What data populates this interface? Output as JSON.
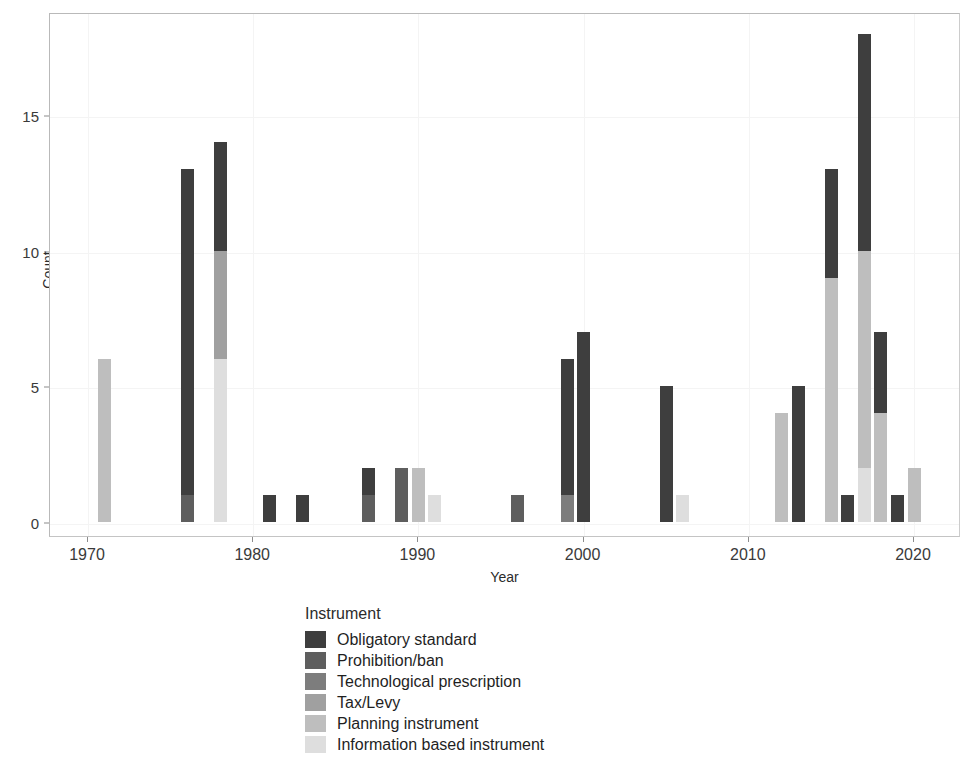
{
  "chart_data": {
    "type": "bar",
    "subtype": "stacked-bar",
    "title": "",
    "xlabel": "Year",
    "ylabel": "Count",
    "xlim": [
      1968.5,
      2021.5
    ],
    "ylim": [
      0,
      19.2
    ],
    "x_ticks": [
      1970,
      1980,
      1990,
      2000,
      2010,
      2020
    ],
    "x_tick_labels": [
      "1970",
      "1980",
      "1990",
      "2000",
      "2010",
      "2020"
    ],
    "y_ticks": [
      0,
      5,
      10,
      15
    ],
    "y_tick_labels": [
      "0",
      "5",
      "10",
      "15"
    ],
    "grid": true,
    "legend_position": "bottom",
    "legend_title": "Instrument",
    "series": [
      {
        "name": "Obligatory standard",
        "color": "#3e3e3e",
        "years": [
          1976,
          1978,
          1981,
          1983,
          1987,
          1999,
          2000,
          2005,
          2013,
          2015,
          2016,
          2017,
          2018,
          2019
        ],
        "values": [
          12,
          4,
          1,
          1,
          1,
          5,
          7,
          5,
          5,
          4,
          1,
          8,
          3,
          1
        ]
      },
      {
        "name": "Prohibition/ban",
        "color": "#5e5e5e",
        "years": [
          1976,
          1989,
          1996
        ],
        "values": [
          1,
          2,
          1
        ]
      },
      {
        "name": "Technological prescription",
        "color": "#7d7d7d",
        "years": [
          1999
        ],
        "values": [
          1
        ]
      },
      {
        "name": "Tax/Levy",
        "color": "#a0a0a0",
        "years": [
          1978
        ],
        "values": [
          4
        ]
      },
      {
        "name": "Planning instrument",
        "color": "#bebebe",
        "years": [
          1971,
          1989,
          2012,
          2015,
          2017,
          2018,
          2020
        ],
        "values": [
          6,
          2,
          4,
          9,
          8,
          4,
          2
        ]
      },
      {
        "name": "Information based instrument",
        "color": "#dedede",
        "years": [
          1978,
          1990,
          2006,
          2017
        ],
        "values": [
          6,
          1,
          1,
          2
        ]
      }
    ],
    "bars": [
      {
        "year": 1971,
        "total": 6,
        "segments": [
          {
            "series": "Planning instrument",
            "value": 6
          }
        ]
      },
      {
        "year": 1976,
        "total": 13,
        "segments": [
          {
            "series": "Prohibition/ban",
            "value": 1
          },
          {
            "series": "Obligatory standard",
            "value": 12
          }
        ]
      },
      {
        "year": 1978,
        "total": 14,
        "segments": [
          {
            "series": "Information based instrument",
            "value": 6
          },
          {
            "series": "Tax/Levy",
            "value": 4
          },
          {
            "series": "Obligatory standard",
            "value": 4
          }
        ]
      },
      {
        "year": 1981,
        "total": 1,
        "segments": [
          {
            "series": "Obligatory standard",
            "value": 1
          }
        ]
      },
      {
        "year": 1983,
        "total": 1,
        "segments": [
          {
            "series": "Obligatory standard",
            "value": 1
          }
        ]
      },
      {
        "year": 1987,
        "total": 2,
        "segments": [
          {
            "series": "Prohibition/ban",
            "value": 1
          },
          {
            "series": "Obligatory standard",
            "value": 1
          }
        ]
      },
      {
        "year": 1989,
        "total": 2,
        "segments": [
          {
            "series": "Prohibition/ban",
            "value": 2
          }
        ]
      },
      {
        "year": 1990,
        "total": 2,
        "segments": [
          {
            "series": "Planning instrument",
            "value": 2
          }
        ]
      },
      {
        "year": 1991,
        "total": 1,
        "segments": [
          {
            "series": "Information based instrument",
            "value": 1
          }
        ]
      },
      {
        "year": 1996,
        "total": 1,
        "segments": [
          {
            "series": "Prohibition/ban",
            "value": 1
          }
        ]
      },
      {
        "year": 1999,
        "total": 6,
        "segments": [
          {
            "series": "Technological prescription",
            "value": 1
          },
          {
            "series": "Obligatory standard",
            "value": 5
          }
        ]
      },
      {
        "year": 2000,
        "total": 7,
        "segments": [
          {
            "series": "Obligatory standard",
            "value": 7
          }
        ]
      },
      {
        "year": 2005,
        "total": 5,
        "segments": [
          {
            "series": "Obligatory standard",
            "value": 5
          }
        ]
      },
      {
        "year": 2006,
        "total": 1,
        "segments": [
          {
            "series": "Information based instrument",
            "value": 1
          }
        ]
      },
      {
        "year": 2012,
        "total": 4,
        "segments": [
          {
            "series": "Planning instrument",
            "value": 4
          }
        ]
      },
      {
        "year": 2013,
        "total": 5,
        "segments": [
          {
            "series": "Obligatory standard",
            "value": 5
          }
        ]
      },
      {
        "year": 2015,
        "total": 13,
        "segments": [
          {
            "series": "Planning instrument",
            "value": 9
          },
          {
            "series": "Obligatory standard",
            "value": 4
          }
        ]
      },
      {
        "year": 2016,
        "total": 1,
        "segments": [
          {
            "series": "Obligatory standard",
            "value": 1
          }
        ]
      },
      {
        "year": 2017,
        "total": 18,
        "segments": [
          {
            "series": "Information based instrument",
            "value": 2
          },
          {
            "series": "Planning instrument",
            "value": 8
          },
          {
            "series": "Obligatory standard",
            "value": 8
          }
        ]
      },
      {
        "year": 2018,
        "total": 7,
        "segments": [
          {
            "series": "Planning instrument",
            "value": 4
          },
          {
            "series": "Obligatory standard",
            "value": 3
          }
        ]
      },
      {
        "year": 2019,
        "total": 1,
        "segments": [
          {
            "series": "Obligatory standard",
            "value": 1
          }
        ]
      },
      {
        "year": 2020,
        "total": 2,
        "segments": [
          {
            "series": "Planning instrument",
            "value": 2
          }
        ]
      }
    ]
  },
  "axes": {
    "y_title": "Count",
    "x_title": "Year",
    "y_tick_labels": [
      "0",
      "5",
      "10",
      "15"
    ],
    "x_tick_labels": [
      "1970",
      "1980",
      "1990",
      "2000",
      "2010",
      "2020"
    ]
  },
  "legend": {
    "title": "Instrument",
    "items": [
      {
        "label": "Obligatory standard",
        "color": "#3e3e3e"
      },
      {
        "label": "Prohibition/ban",
        "color": "#5e5e5e"
      },
      {
        "label": "Technological prescription",
        "color": "#7d7d7d"
      },
      {
        "label": "Tax/Levy",
        "color": "#a0a0a0"
      },
      {
        "label": "Planning instrument",
        "color": "#bebebe"
      },
      {
        "label": "Information based instrument",
        "color": "#dedede"
      }
    ]
  }
}
